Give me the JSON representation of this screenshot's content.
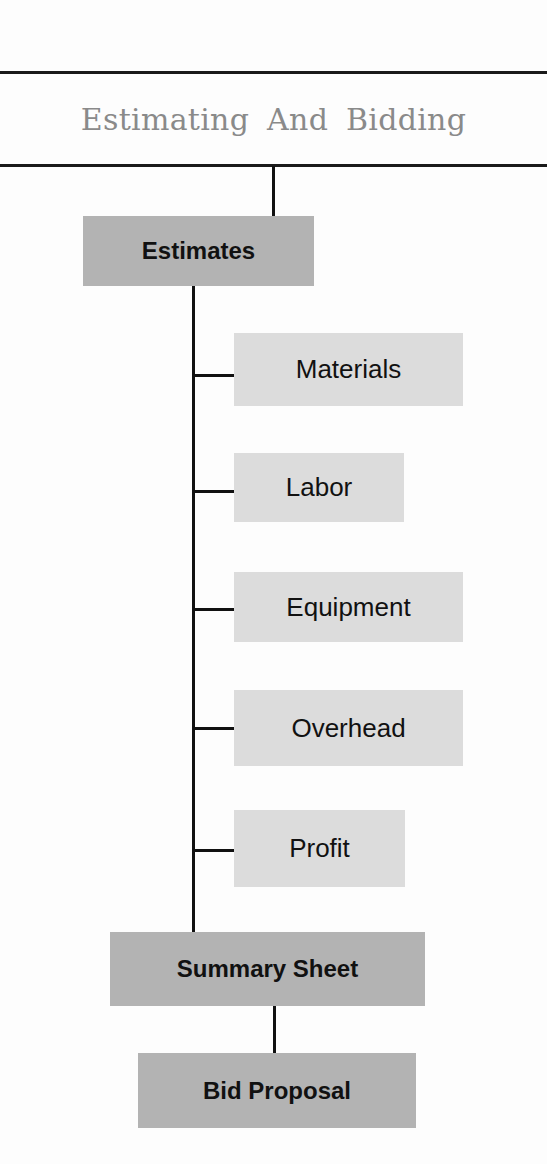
{
  "diagram": {
    "title": "Estimating And Bidding",
    "root": "Estimates",
    "components": [
      {
        "label": "Materials"
      },
      {
        "label": "Labor"
      },
      {
        "label": "Equipment"
      },
      {
        "label": "Overhead"
      },
      {
        "label": "Profit"
      }
    ],
    "summary": "Summary Sheet",
    "final": "Bid Proposal"
  },
  "colors": {
    "major_box": "#b3b3b3",
    "minor_box": "#dcdcdc",
    "line": "#111111",
    "title_text": "#8a8a8a"
  }
}
